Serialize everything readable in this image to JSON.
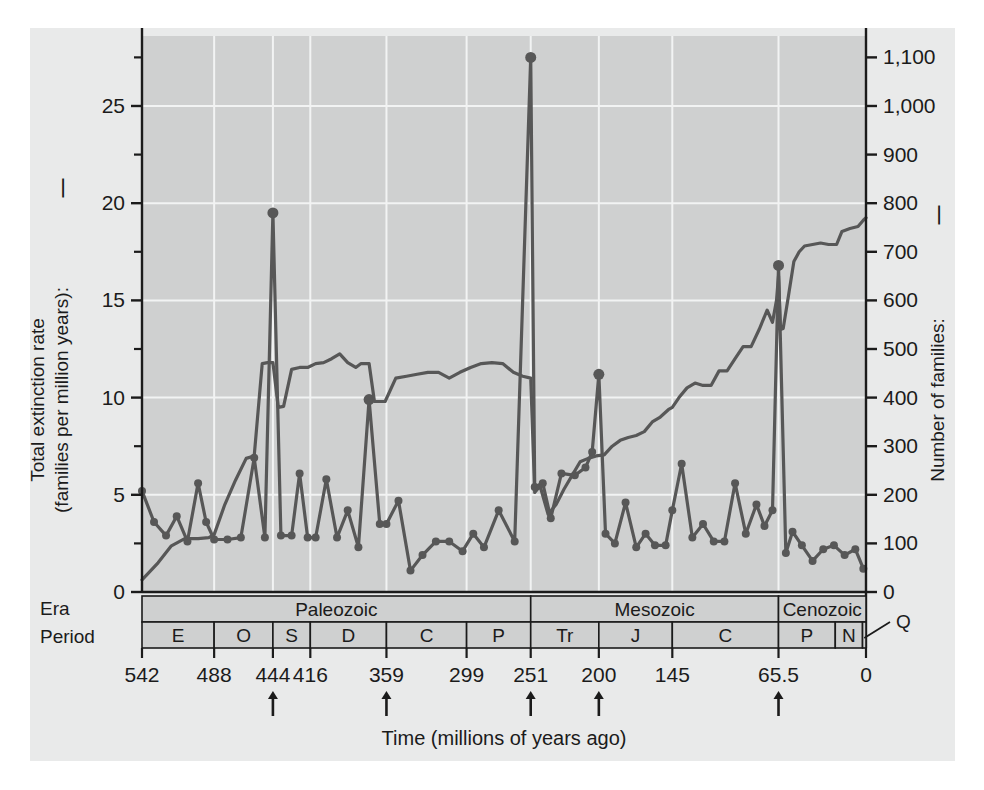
{
  "figure": {
    "background_color": "#e9eaea",
    "plot_background_color": "#cfd0d0",
    "grid_color": "#f2f3f3",
    "line_color": "#575757",
    "axis_color": "#1b1b1b"
  },
  "axes": {
    "left": {
      "title_line1": "Total extinction rate",
      "title_line2": "(families per million years):",
      "legend_dash": "—",
      "ticks": [
        0,
        5,
        10,
        15,
        20,
        25
      ],
      "tick_labels": [
        "0",
        "5",
        "10",
        "15",
        "20",
        "25"
      ],
      "min": 0,
      "max": 28.6
    },
    "right": {
      "title": "Number of families:",
      "legend_dash": "—",
      "ticks": [
        0,
        100,
        200,
        300,
        400,
        500,
        600,
        700,
        800,
        900,
        1000,
        1100
      ],
      "tick_labels": [
        "0",
        "100",
        "200",
        "300",
        "400",
        "500",
        "600",
        "700",
        "800",
        "900",
        "1,000",
        "1,100"
      ],
      "min": 0,
      "max": 1144
    },
    "bottom": {
      "title": "Time (millions of years ago)",
      "tick_values": [
        542,
        488,
        444,
        416,
        359,
        299,
        251,
        200,
        145,
        65.5,
        0
      ],
      "tick_labels": [
        "542",
        "488",
        "444",
        "416",
        "359",
        "299",
        "251",
        "200",
        "145",
        "65.5",
        "0"
      ],
      "min": 542,
      "max": 0
    }
  },
  "mass_extinction_arrows": [
    444,
    359,
    251,
    200,
    65.5
  ],
  "timescale": {
    "row_labels": [
      "Era",
      "Period"
    ],
    "eras": [
      {
        "label": "Paleozoic",
        "start": 542,
        "end": 251
      },
      {
        "label": "Mesozoic",
        "start": 251,
        "end": 65.5
      },
      {
        "label": "Cenozoic",
        "start": 65.5,
        "end": 0
      }
    ],
    "periods": [
      {
        "label": "E",
        "start": 542,
        "end": 488
      },
      {
        "label": "O",
        "start": 488,
        "end": 444
      },
      {
        "label": "S",
        "start": 444,
        "end": 416
      },
      {
        "label": "D",
        "start": 416,
        "end": 359
      },
      {
        "label": "C",
        "start": 359,
        "end": 299
      },
      {
        "label": "P",
        "start": 299,
        "end": 251
      },
      {
        "label": "Tr",
        "start": 251,
        "end": 200
      },
      {
        "label": "J",
        "start": 200,
        "end": 145
      },
      {
        "label": "C",
        "start": 145,
        "end": 65.5
      },
      {
        "label": "P",
        "start": 65.5,
        "end": 23
      },
      {
        "label": "N",
        "start": 23,
        "end": 2.6
      },
      {
        "label": "Q",
        "start": 2.6,
        "end": 0,
        "callout": true
      }
    ],
    "callout_label": "Q"
  },
  "chart_data": {
    "type": "line",
    "title": "",
    "xlabel": "Time (millions of years ago)",
    "ylabel": "Total extinction rate (families per million years)",
    "ylabel_right": "Number of families",
    "xlim": [
      542,
      0
    ],
    "ylim": [
      0,
      28.6
    ],
    "ylim_right": [
      0,
      1144
    ],
    "grid": true,
    "legend_position": "axis-titles",
    "series": [
      {
        "name": "Total extinction rate (families per million years)",
        "axis": "left",
        "markers": true,
        "points": [
          [
            542,
            5.2
          ],
          [
            533,
            3.6
          ],
          [
            524,
            2.9
          ],
          [
            516,
            3.9
          ],
          [
            508,
            2.6
          ],
          [
            500,
            5.6
          ],
          [
            494,
            3.6
          ],
          [
            488,
            2.7
          ],
          [
            478,
            2.7
          ],
          [
            468,
            2.8
          ],
          [
            458,
            6.9
          ],
          [
            450,
            2.8
          ],
          [
            444,
            19.5
          ],
          [
            438,
            2.9
          ],
          [
            430,
            2.9
          ],
          [
            424,
            6.1
          ],
          [
            418,
            2.8
          ],
          [
            412,
            2.8
          ],
          [
            404,
            5.8
          ],
          [
            396,
            2.8
          ],
          [
            388,
            4.2
          ],
          [
            380,
            2.3
          ],
          [
            372,
            9.9
          ],
          [
            364,
            3.5
          ],
          [
            359,
            3.5
          ],
          [
            350,
            4.7
          ],
          [
            341,
            1.1
          ],
          [
            332,
            1.9
          ],
          [
            322,
            2.6
          ],
          [
            312,
            2.6
          ],
          [
            302,
            2.1
          ],
          [
            294,
            3.0
          ],
          [
            286,
            2.3
          ],
          [
            275,
            4.2
          ],
          [
            263,
            2.6
          ],
          [
            251,
            27.5
          ],
          [
            248,
            5.4
          ],
          [
            242,
            5.6
          ],
          [
            236,
            3.8
          ],
          [
            228,
            6.1
          ],
          [
            218,
            6.0
          ],
          [
            210,
            6.4
          ],
          [
            205,
            7.2
          ],
          [
            200,
            11.2
          ],
          [
            195,
            3.0
          ],
          [
            188,
            2.5
          ],
          [
            180,
            4.6
          ],
          [
            172,
            2.3
          ],
          [
            165,
            3.0
          ],
          [
            158,
            2.4
          ],
          [
            150,
            2.4
          ],
          [
            145,
            4.2
          ],
          [
            138,
            6.6
          ],
          [
            130,
            2.8
          ],
          [
            122,
            3.5
          ],
          [
            114,
            2.6
          ],
          [
            106,
            2.6
          ],
          [
            98,
            5.6
          ],
          [
            90,
            3.0
          ],
          [
            82,
            4.5
          ],
          [
            76,
            3.4
          ],
          [
            70,
            4.2
          ],
          [
            65.5,
            16.8
          ],
          [
            60,
            2.0
          ],
          [
            55,
            3.1
          ],
          [
            48,
            2.4
          ],
          [
            40,
            1.6
          ],
          [
            32,
            2.2
          ],
          [
            24,
            2.4
          ],
          [
            16,
            1.9
          ],
          [
            8,
            2.2
          ],
          [
            2,
            1.2
          ]
        ]
      },
      {
        "name": "Number of families",
        "axis": "right",
        "markers": false,
        "points": [
          [
            542,
            25
          ],
          [
            530,
            60
          ],
          [
            520,
            95
          ],
          [
            510,
            110
          ],
          [
            500,
            110
          ],
          [
            492,
            112
          ],
          [
            488,
            118
          ],
          [
            480,
            180
          ],
          [
            472,
            230
          ],
          [
            464,
            275
          ],
          [
            458,
            280
          ],
          [
            452,
            470
          ],
          [
            448,
            472
          ],
          [
            444,
            472
          ],
          [
            440,
            380
          ],
          [
            436,
            382
          ],
          [
            430,
            458
          ],
          [
            424,
            462
          ],
          [
            418,
            462
          ],
          [
            412,
            470
          ],
          [
            406,
            472
          ],
          [
            400,
            480
          ],
          [
            394,
            490
          ],
          [
            388,
            472
          ],
          [
            382,
            462
          ],
          [
            378,
            470
          ],
          [
            372,
            470
          ],
          [
            368,
            392
          ],
          [
            360,
            392
          ],
          [
            352,
            440
          ],
          [
            344,
            444
          ],
          [
            336,
            448
          ],
          [
            328,
            452
          ],
          [
            320,
            452
          ],
          [
            312,
            440
          ],
          [
            304,
            452
          ],
          [
            296,
            462
          ],
          [
            288,
            470
          ],
          [
            280,
            472
          ],
          [
            272,
            470
          ],
          [
            264,
            452
          ],
          [
            257,
            444
          ],
          [
            251,
            440
          ],
          [
            248,
            205
          ],
          [
            244,
            218
          ],
          [
            238,
            160
          ],
          [
            232,
            180
          ],
          [
            226,
            212
          ],
          [
            220,
            240
          ],
          [
            214,
            268
          ],
          [
            208,
            275
          ],
          [
            202,
            280
          ],
          [
            196,
            282
          ],
          [
            190,
            300
          ],
          [
            184,
            312
          ],
          [
            178,
            318
          ],
          [
            172,
            322
          ],
          [
            166,
            330
          ],
          [
            160,
            350
          ],
          [
            154,
            360
          ],
          [
            148,
            375
          ],
          [
            145,
            380
          ],
          [
            140,
            400
          ],
          [
            134,
            420
          ],
          [
            128,
            430
          ],
          [
            122,
            425
          ],
          [
            116,
            425
          ],
          [
            110,
            455
          ],
          [
            104,
            455
          ],
          [
            98,
            480
          ],
          [
            92,
            505
          ],
          [
            86,
            505
          ],
          [
            80,
            540
          ],
          [
            74,
            580
          ],
          [
            70,
            555
          ],
          [
            67,
            600
          ],
          [
            65.5,
            650
          ],
          [
            64,
            540
          ],
          [
            62,
            542
          ],
          [
            58,
            610
          ],
          [
            54,
            680
          ],
          [
            50,
            700
          ],
          [
            46,
            712
          ],
          [
            40,
            715
          ],
          [
            34,
            718
          ],
          [
            28,
            715
          ],
          [
            22,
            715
          ],
          [
            18,
            742
          ],
          [
            12,
            748
          ],
          [
            6,
            752
          ],
          [
            2,
            765
          ],
          [
            0,
            770
          ]
        ]
      }
    ]
  }
}
